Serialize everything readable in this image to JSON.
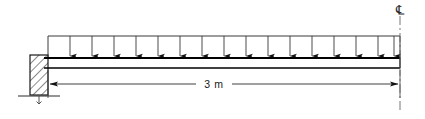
{
  "diagram": {
    "type": "structural-beam-free-body-diagram",
    "title": "",
    "dimension_label": "3 m",
    "centerline_symbol": "℄",
    "span_length_value": 3,
    "span_length_unit": "m",
    "load": {
      "kind": "uniformly-distributed-load",
      "arrow_count": 16,
      "direction": "down",
      "label": ""
    },
    "support": {
      "kind": "fixed-wall-support",
      "hatch_angle_deg": 45,
      "position": "left"
    },
    "colors": {
      "line": "#1a1a1a",
      "beam": "#000000",
      "hatch": "#2b2b2b",
      "dimension": "#3a3a3a",
      "centerline": "#555555",
      "background": "#ffffff"
    }
  },
  "geometry": {
    "beam_left_x": 48,
    "beam_right_x": 400,
    "beam_top_y": 58,
    "beam_bottom_y": 68,
    "load_top_y": 36,
    "dimension_y": 84,
    "support_left_x": 30,
    "support_right_x": 48,
    "support_top_y": 55,
    "support_bottom_y": 95,
    "ground_y": 96,
    "centerline_x": 400
  }
}
